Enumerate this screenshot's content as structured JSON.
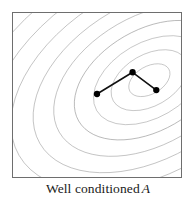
{
  "figure": {
    "type": "contour-plot-with-path",
    "caption_prefix": "Well conditioned",
    "caption_variable": "A",
    "caption_full": "Well conditioned A"
  },
  "colors": {
    "background": "#ffffff",
    "frame_border": "#6e6e6e",
    "contour_line": "#8c8c8c",
    "path_line": "#111111",
    "path_marker": "#000000",
    "caption_text": "#1a1a1a"
  },
  "chart_data": {
    "type": "line",
    "xlabel": "",
    "ylabel": "",
    "grid": false,
    "legend": "none",
    "axis_ticks": [],
    "plot_area_px": {
      "x": 12,
      "y": 12,
      "width": 170,
      "height": 166
    },
    "contours": {
      "description": "Nested elliptical level sets of a well-conditioned quadratic form; near-circular aspect ratio, tilted major axis",
      "center_px": {
        "x": 150,
        "y": 80
      },
      "rotation_deg": -30,
      "aspect_ratio": 1.62,
      "count": 18,
      "radii_px": [
        14,
        26,
        38,
        51,
        65,
        79,
        94,
        110,
        126,
        143,
        160,
        178,
        196,
        215,
        234,
        254,
        274,
        295
      ]
    },
    "path": {
      "description": "Optimization iterate path with three marked points",
      "points_px": [
        {
          "label": "p1",
          "x": 97,
          "y": 94
        },
        {
          "label": "p2",
          "x": 133,
          "y": 72
        },
        {
          "label": "p3",
          "x": 157,
          "y": 90
        }
      ],
      "marker_radius_px": 3.2,
      "line_width_px": 1.6
    }
  }
}
